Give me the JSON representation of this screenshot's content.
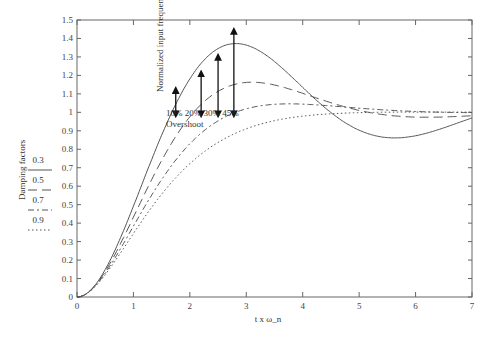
{
  "chart_data": {
    "type": "line",
    "title": "",
    "xlabel": "t x ω_n",
    "ylabel": "Normalized input frequency",
    "xlim": [
      0,
      7
    ],
    "ylim": [
      0,
      1.5
    ],
    "xticks": [
      "0",
      "1",
      "2",
      "3",
      "4",
      "5",
      "6",
      "7"
    ],
    "yticks": [
      "0",
      "0.1",
      "0.2",
      "0.3",
      "0.4",
      "0.5",
      "0.6",
      "0.7",
      "0.8",
      "0.9",
      "1",
      "1.1",
      "1.2",
      "1.3",
      "1.4",
      "1.5"
    ],
    "grid": false,
    "legend": {
      "title": "Damping factors",
      "position": "left",
      "entries": [
        {
          "label": "0.3",
          "style": "solid"
        },
        {
          "label": "0.5",
          "style": "long-dash"
        },
        {
          "label": "0.7",
          "style": "dash-dot"
        },
        {
          "label": "0.9",
          "style": "dotted"
        }
      ]
    },
    "series": [
      {
        "name": "0.3",
        "damping": 0.3,
        "peak": 1.45,
        "peak_x": 2.7,
        "min": 0.83,
        "min_x": 6.0
      },
      {
        "name": "0.5",
        "damping": 0.5,
        "peak": 1.3,
        "peak_x": 2.4
      },
      {
        "name": "0.7",
        "damping": 0.7,
        "peak": 1.2,
        "peak_x": 2.1
      },
      {
        "name": "0.9",
        "damping": 0.9,
        "peak": 1.13,
        "peak_x": 2.0
      }
    ],
    "annotations": {
      "arrows": [
        {
          "label": "10%",
          "x": 1.75,
          "from": 1.0,
          "to": 1.11
        },
        {
          "label": "20%",
          "x": 2.2,
          "from": 1.0,
          "to": 1.2
        },
        {
          "label": "30%",
          "x": 2.5,
          "from": 1.0,
          "to": 1.29
        },
        {
          "label": "45%",
          "x": 2.78,
          "from": 1.0,
          "to": 1.43
        }
      ],
      "caption": "Overshoot"
    }
  }
}
